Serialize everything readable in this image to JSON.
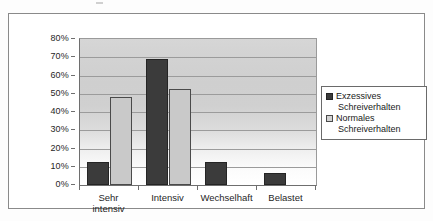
{
  "chart_data": {
    "type": "bar",
    "title": "",
    "subtitle": "",
    "xlabel": "",
    "ylabel": "",
    "categories": [
      "Sehr intensiv",
      "Intensiv",
      "Wechselhaft",
      "Belastet"
    ],
    "category_lines": [
      [
        "Sehr",
        "intensiv"
      ],
      [
        "Intensiv"
      ],
      [
        "Wechselhaft"
      ],
      [
        "Belastet"
      ]
    ],
    "series": [
      {
        "name": "Exzessives Schreiverhalten",
        "name_lines": [
          "Exzessives",
          "Schreiverhalten"
        ],
        "color": "#3b3b3b",
        "values": [
          12.5,
          69,
          12.5,
          6.5
        ]
      },
      {
        "name": "Normales Schreiverhalten",
        "name_lines": [
          "Normales",
          "Schreiverhalten"
        ],
        "color": "#c9c9c9",
        "values": [
          48,
          52.5,
          0,
          0
        ]
      }
    ],
    "ylim": [
      0,
      80
    ],
    "ytick_step": 10,
    "ytick_labels": [
      "80%",
      "70%",
      "60%",
      "50%",
      "40%",
      "30%",
      "20%",
      "10%",
      "0%"
    ],
    "ytick_values": [
      80,
      70,
      60,
      50,
      40,
      30,
      20,
      10,
      0
    ],
    "value_suffix": "%",
    "grid": true,
    "grid_axis": "y",
    "legend_position": "right",
    "plot_background": "gradient-gray-to-white",
    "frame": true
  }
}
